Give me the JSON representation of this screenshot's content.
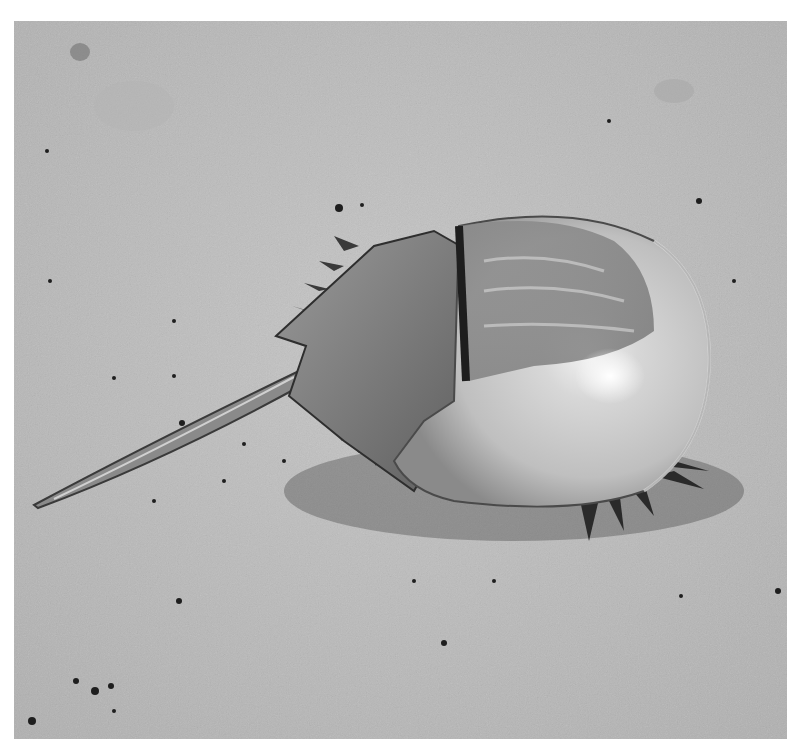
{
  "image": {
    "subject": "Horseshoe crab on sand",
    "style": "grayscale photograph",
    "background_color": "#ffffff",
    "sand_color": "#bdbdbd",
    "carapace_color": "#c9c9c9",
    "highlight_color": "#f4f4f4",
    "shadow_color": "#2e2e2e"
  }
}
